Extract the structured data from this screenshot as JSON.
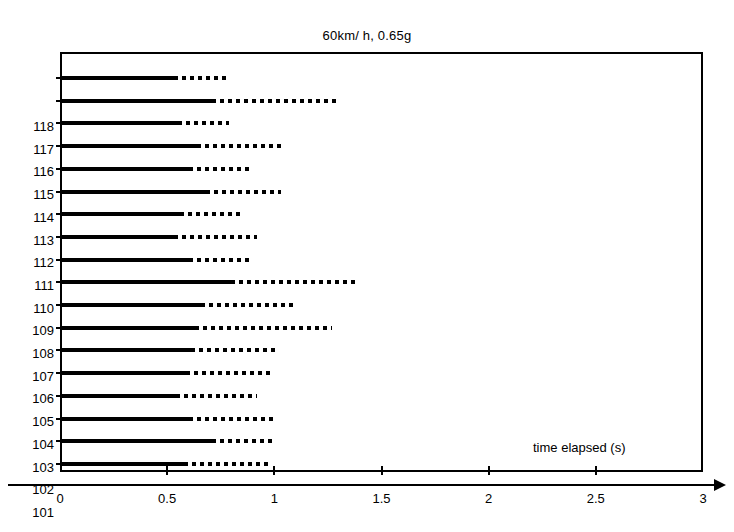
{
  "chart_data": {
    "type": "bar",
    "title": "60km/ h, 0.65g",
    "xlabel": "time elapsed (s)",
    "ylabel": "",
    "xlim": [
      0,
      3
    ],
    "xticks": [
      0,
      0.5,
      1,
      1.5,
      2,
      2.5,
      3
    ],
    "xticklabels": [
      "0",
      "0.5",
      "1",
      "1.5",
      "2",
      "2.5",
      "3"
    ],
    "grid": false,
    "legend": null,
    "orientation": "horizontal",
    "categories": [
      "118",
      "117",
      "116",
      "115",
      "114",
      "113",
      "112",
      "111",
      "110",
      "109",
      "108",
      "107",
      "106",
      "105",
      "104",
      "103",
      "102",
      "101"
    ],
    "series": [
      {
        "name": "solid segment (reaction)",
        "style": "solid",
        "values": [
          0.53,
          0.71,
          0.55,
          0.64,
          0.6,
          0.68,
          0.56,
          0.53,
          0.6,
          0.8,
          0.66,
          0.63,
          0.61,
          0.59,
          0.54,
          0.6,
          0.71,
          0.58
        ]
      },
      {
        "name": "dotted segment (total)",
        "style": "dotted",
        "values": [
          0.79,
          1.3,
          0.79,
          1.04,
          0.88,
          1.03,
          0.86,
          0.92,
          0.88,
          1.38,
          1.09,
          1.27,
          1.02,
          0.99,
          0.92,
          1.0,
          1.01,
          0.99
        ]
      }
    ],
    "rows": [
      {
        "label": "118",
        "solid_end": 0.53,
        "dotted_end": 0.79
      },
      {
        "label": "117",
        "solid_end": 0.71,
        "dotted_end": 1.3
      },
      {
        "label": "116",
        "solid_end": 0.55,
        "dotted_end": 0.79
      },
      {
        "label": "115",
        "solid_end": 0.64,
        "dotted_end": 1.04
      },
      {
        "label": "114",
        "solid_end": 0.6,
        "dotted_end": 0.88
      },
      {
        "label": "113",
        "solid_end": 0.68,
        "dotted_end": 1.03
      },
      {
        "label": "112",
        "solid_end": 0.56,
        "dotted_end": 0.86
      },
      {
        "label": "111",
        "solid_end": 0.53,
        "dotted_end": 0.92
      },
      {
        "label": "110",
        "solid_end": 0.6,
        "dotted_end": 0.88
      },
      {
        "label": "109",
        "solid_end": 0.8,
        "dotted_end": 1.38
      },
      {
        "label": "108",
        "solid_end": 0.66,
        "dotted_end": 1.09
      },
      {
        "label": "107",
        "solid_end": 0.63,
        "dotted_end": 1.27
      },
      {
        "label": "106",
        "solid_end": 0.61,
        "dotted_end": 1.02
      },
      {
        "label": "105",
        "solid_end": 0.59,
        "dotted_end": 0.99
      },
      {
        "label": "104",
        "solid_end": 0.54,
        "dotted_end": 0.92
      },
      {
        "label": "103",
        "solid_end": 0.6,
        "dotted_end": 1.0
      },
      {
        "label": "102",
        "solid_end": 0.71,
        "dotted_end": 1.01
      },
      {
        "label": "101",
        "solid_end": 0.58,
        "dotted_end": 0.99
      }
    ]
  },
  "colors": {
    "ink": "#000000",
    "background": "#ffffff"
  }
}
